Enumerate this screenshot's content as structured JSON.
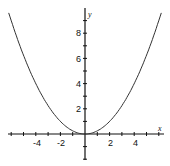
{
  "chart_data": {
    "type": "line",
    "xlabel": "x",
    "ylabel": "y",
    "function": "y = x^2 / 4",
    "xlim": [
      -6.2,
      6.2
    ],
    "ylim": [
      -2,
      10
    ],
    "x_tick_labels": [
      "-4",
      "-2",
      "2",
      "4"
    ],
    "y_tick_labels": [
      "2",
      "4",
      "6",
      "8"
    ],
    "x_ticks": [
      -6,
      -5,
      -4,
      -3,
      -2,
      -1,
      1,
      2,
      3,
      4,
      5,
      6
    ],
    "y_ticks": [
      -2,
      -1,
      1,
      2,
      3,
      4,
      5,
      6,
      7,
      8,
      9
    ],
    "grid": false,
    "legend": "none",
    "series": [
      {
        "name": "y = x²/4",
        "x": [
          -6,
          -5,
          -4,
          -3,
          -2,
          -1,
          0,
          1,
          2,
          3,
          4,
          5,
          6
        ],
        "values": [
          9,
          6.25,
          4,
          2.25,
          1,
          0.25,
          0,
          0.25,
          1,
          2.25,
          4,
          6.25,
          9
        ]
      }
    ]
  },
  "labels": {
    "x_axis": "x",
    "y_axis": "y",
    "xt": [
      "-4",
      "-2",
      "2",
      "4"
    ],
    "yt": [
      "2",
      "4",
      "6",
      "8"
    ]
  }
}
